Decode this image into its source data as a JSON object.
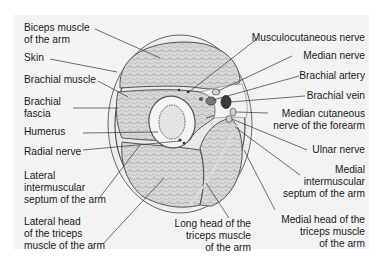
{
  "figure": {
    "colors": {
      "background": "#ffffff",
      "panel": "#f3f3f3",
      "muscle_fill": "#d6d6d6",
      "outline": "#555555",
      "leader_line": "#333333",
      "vessel_dark": "#3a3a3a"
    }
  },
  "labels_left": [
    {
      "id": "biceps",
      "text": "Biceps muscle\nof the arm"
    },
    {
      "id": "skin",
      "text": "Skin"
    },
    {
      "id": "brachial_muscle",
      "text": "Brachial muscle"
    },
    {
      "id": "brachial_fascia",
      "text": "Brachial\nfascia"
    },
    {
      "id": "humerus",
      "text": "Humerus"
    },
    {
      "id": "radial_nerve",
      "text": "Radial nerve"
    },
    {
      "id": "lateral_septum",
      "text": "Lateral\nintermuscular\nseptum of the arm"
    },
    {
      "id": "lateral_head_triceps",
      "text": "Lateral head\nof the triceps\nmuscle of the arm"
    }
  ],
  "labels_right": [
    {
      "id": "musculocutaneous",
      "text": "Musculocutaneous nerve"
    },
    {
      "id": "median_nerve",
      "text": "Median nerve"
    },
    {
      "id": "brachial_artery",
      "text": "Brachial artery"
    },
    {
      "id": "brachial_vein",
      "text": "Brachial vein"
    },
    {
      "id": "median_cutaneous",
      "text": "Median cutaneous\nnerve of the forearm"
    },
    {
      "id": "ulnar_nerve",
      "text": "Ulnar nerve"
    },
    {
      "id": "medial_septum",
      "text": "Medial\nintermuscular\nseptum of the arm"
    },
    {
      "id": "medial_head_triceps",
      "text": "Medial head of the\ntriceps muscle\nof the arm"
    }
  ],
  "labels_bottom": [
    {
      "id": "long_head_triceps",
      "text": "Long head of the\ntriceps muscle\nof the arm"
    }
  ]
}
